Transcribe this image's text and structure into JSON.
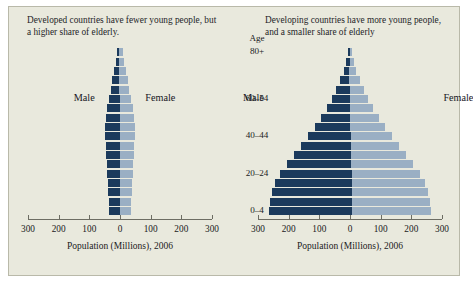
{
  "panel": {
    "background_color": "#e9e9dd",
    "border_color": "#b9b9a9"
  },
  "colors": {
    "male_bar": "#1b3a5c",
    "female_bar": "#9aafc4",
    "axis": "#6d6d63",
    "text": "#1a1a22"
  },
  "age_axis": {
    "header": "Age",
    "labels": [
      "80+",
      "60–54",
      "40–44",
      "20–24",
      "0–4"
    ]
  },
  "charts": [
    {
      "id": "developed",
      "caption": "Developed countries have fewer young people, but a higher share of elderly.",
      "male_label": "Male",
      "female_label": "Female"
    },
    {
      "id": "developing",
      "caption": "Developing countries have more young people, and a smaller share of elderly",
      "male_label": "Male",
      "female_label": "Female"
    }
  ],
  "chart_data": [
    {
      "type": "bar",
      "id": "developed",
      "orientation": "horizontal-diverging",
      "title": "Developed countries have fewer young people, but a higher share of elderly.",
      "xlabel": "Population (Millions), 2006",
      "ylabel": "Age",
      "xlim": [
        -300,
        300
      ],
      "xticks": [
        300,
        200,
        100,
        0,
        100,
        200,
        300
      ],
      "xtick_labels": [
        "300",
        "200",
        "100",
        "0",
        "100",
        "200",
        "300"
      ],
      "grid": false,
      "legend": [
        "Male",
        "Female"
      ],
      "legend_position": "inline-flanking",
      "categories": [
        "0–4",
        "5–9",
        "10–14",
        "15–19",
        "20–24",
        "25–29",
        "30–34",
        "35–39",
        "40–44",
        "45–49",
        "50–54",
        "55–59",
        "60–64",
        "65–69",
        "70–74",
        "75–79",
        "80–84",
        "85+"
      ],
      "series": [
        {
          "name": "Male",
          "values": [
            36,
            37,
            39,
            41,
            42,
            43,
            45,
            47,
            50,
            49,
            45,
            40,
            34,
            27,
            23,
            17,
            11,
            6
          ]
        },
        {
          "name": "Female",
          "values": [
            34,
            35,
            37,
            39,
            40,
            42,
            44,
            46,
            49,
            49,
            46,
            42,
            37,
            31,
            28,
            23,
            17,
            12
          ]
        }
      ]
    },
    {
      "type": "bar",
      "id": "developing",
      "orientation": "horizontal-diverging",
      "title": "Developing countries have more young people, and a smaller share of elderly",
      "xlabel": "Population (Millions), 2006",
      "ylabel": "Age",
      "xlim": [
        -300,
        300
      ],
      "xticks": [
        300,
        200,
        100,
        0,
        100,
        200,
        300
      ],
      "xtick_labels": [
        "300",
        "200",
        "100",
        "0",
        "100",
        "200",
        "300"
      ],
      "grid": false,
      "legend": [
        "Male",
        "Female"
      ],
      "legend_position": "inline-flanking",
      "categories": [
        "0–4",
        "5–9",
        "10–14",
        "15–19",
        "20–24",
        "25–29",
        "30–34",
        "35–39",
        "40–44",
        "45–49",
        "50–54",
        "55–59",
        "60–64",
        "65–69",
        "70–74",
        "75–79",
        "80–84",
        "85+"
      ],
      "series": [
        {
          "name": "Male",
          "values": [
            272,
            268,
            262,
            250,
            232,
            208,
            186,
            162,
            138,
            114,
            94,
            74,
            58,
            43,
            30,
            19,
            11,
            5
          ]
        },
        {
          "name": "Female",
          "values": [
            258,
            254,
            248,
            238,
            222,
            200,
            180,
            157,
            134,
            112,
            93,
            75,
            60,
            46,
            34,
            23,
            14,
            7
          ]
        }
      ]
    }
  ]
}
